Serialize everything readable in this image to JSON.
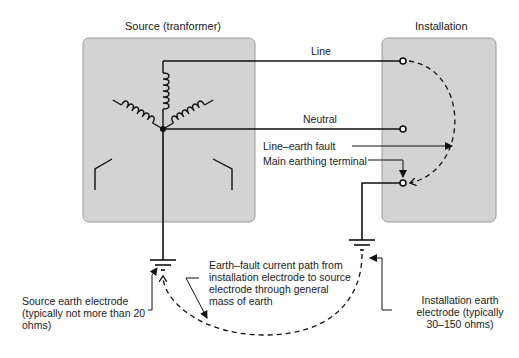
{
  "source": {
    "title": "Source (tranformer)",
    "electrode_label": [
      "Source earth electrode",
      "(typically not more than 20",
      "ohms)"
    ]
  },
  "installation": {
    "title": "Installation",
    "electrode_label": [
      "Installation earth",
      "electrode (typically",
      "30–150 ohms)"
    ]
  },
  "conductors": {
    "line": "Line",
    "neutral": "Neutral"
  },
  "annotations": {
    "line_earth_fault": "Line–earth fault",
    "main_earthing_terminal": "Main earthing terminal",
    "earth_path": [
      "Earth–fault current path from",
      "installation electrode to source",
      "electrode through general",
      "mass of earth"
    ]
  },
  "colors": {
    "box_fill": "#d3d3d3",
    "box_stroke": "#9a9a9a",
    "wire": "#111111"
  }
}
